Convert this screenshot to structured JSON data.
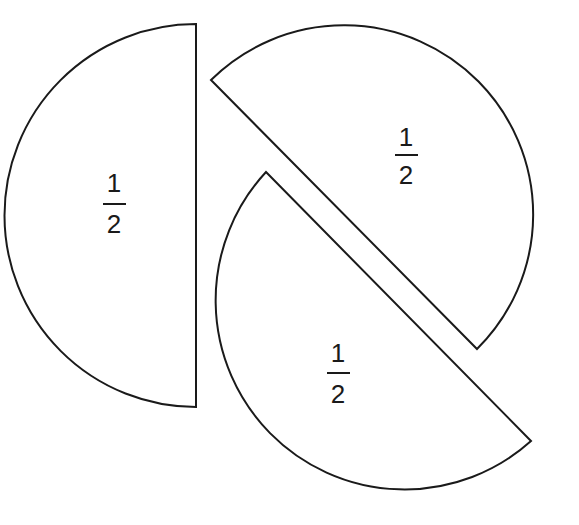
{
  "diagram": {
    "stroke_color": "#1a1a1a",
    "background": "#ffffff",
    "pieces": [
      {
        "id": "left-half",
        "label": {
          "numerator": "1",
          "denominator": "2"
        }
      },
      {
        "id": "upper-right-half",
        "label": {
          "numerator": "1",
          "denominator": "2"
        }
      },
      {
        "id": "lower-half",
        "label": {
          "numerator": "1",
          "denominator": "2"
        }
      }
    ]
  }
}
